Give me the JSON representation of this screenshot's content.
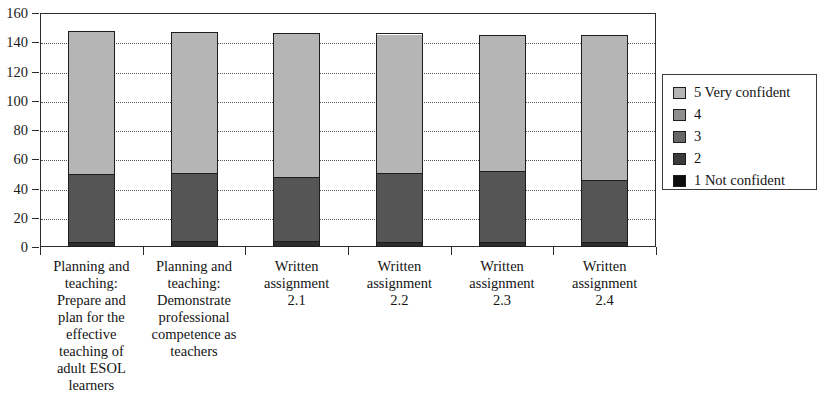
{
  "chart_data": {
    "type": "bar",
    "stacked": true,
    "title": "",
    "xlabel": "",
    "ylabel": "",
    "ylim": [
      0,
      160
    ],
    "ytick_step": 20,
    "yticks": [
      0,
      20,
      40,
      60,
      80,
      100,
      120,
      140,
      160
    ],
    "grid": true,
    "grid_style": "dotted-horizontal",
    "legend_position": "right",
    "categories": [
      "Planning and teaching: Prepare and plan for the effective teaching of adult ESOL learners",
      "Planning and teaching: Demonstrate professional competence as teachers",
      "Written assignment 2.1",
      "Written assignment 2.2",
      "Written assignment 2.3",
      "Written assignment 2.4"
    ],
    "category_lines": [
      [
        "Planning and",
        "teaching:",
        "Prepare and",
        "plan for the",
        "effective",
        "teaching of",
        "adult ESOL",
        "learners"
      ],
      [
        "Planning and",
        "teaching:",
        "Demonstrate",
        "professional",
        "competence as",
        "teachers"
      ],
      [
        "Written",
        "assignment",
        "2.1"
      ],
      [
        "Written",
        "assignment",
        "2.2"
      ],
      [
        "Written",
        "assignment",
        "2.3"
      ],
      [
        "Written",
        "assignment",
        "2.4"
      ]
    ],
    "series": [
      {
        "name": "1 Not confident",
        "color": "#0d0d0d",
        "values": [
          0,
          0,
          0,
          0,
          0,
          0
        ]
      },
      {
        "name": "2",
        "color": "#2e2e2e",
        "values": [
          2,
          3,
          3,
          2,
          2,
          2
        ]
      },
      {
        "name": "3",
        "color": "#4a4a4a",
        "values": [
          0,
          0,
          0,
          0,
          0,
          0
        ]
      },
      {
        "name": "4",
        "color": "#555555",
        "values": [
          47,
          47,
          44,
          48,
          49,
          43
        ]
      },
      {
        "name": "5 Very confident",
        "color": "#b5b5b5",
        "values": [
          99,
          97,
          99,
          96,
          94,
          100
        ]
      }
    ],
    "totals": [
      148,
      147,
      146,
      146,
      145,
      145
    ]
  },
  "legend": {
    "items": [
      {
        "label": "5 Very confident",
        "color": "#b5b5b5"
      },
      {
        "label": "4",
        "color": "#8f8f8f"
      },
      {
        "label": "3",
        "color": "#666666"
      },
      {
        "label": "2",
        "color": "#3b3b3b"
      },
      {
        "label": "1 Not confident",
        "color": "#0d0d0d"
      }
    ]
  },
  "axis": {
    "y_tick_labels": [
      "160",
      "140",
      "120",
      "100",
      "80",
      "60",
      "40",
      "20",
      "0"
    ]
  }
}
